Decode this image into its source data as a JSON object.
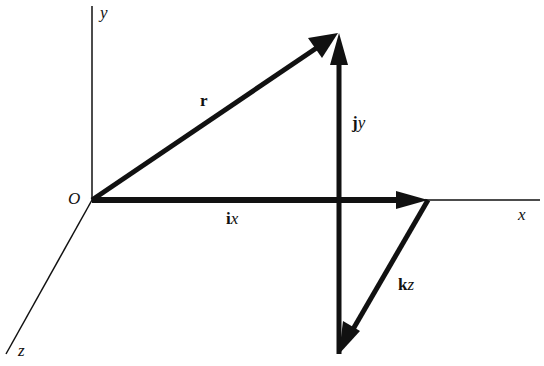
{
  "diagram": {
    "type": "vector-decomposition",
    "axes": {
      "x_label": "x",
      "y_label": "y",
      "z_label": "z",
      "origin_label": "O"
    },
    "vectors": [
      {
        "id": "r",
        "bold": "r",
        "italic": "",
        "description": "position vector from origin"
      },
      {
        "id": "ix",
        "bold": "i",
        "italic": "x",
        "description": "x component along x-axis"
      },
      {
        "id": "jy",
        "bold": "j",
        "italic": "y",
        "description": "y component, vertical"
      },
      {
        "id": "kz",
        "bold": "k",
        "italic": "z",
        "description": "z component, toward viewer"
      }
    ],
    "colors": {
      "line": "#111111",
      "background": "#ffffff"
    }
  }
}
